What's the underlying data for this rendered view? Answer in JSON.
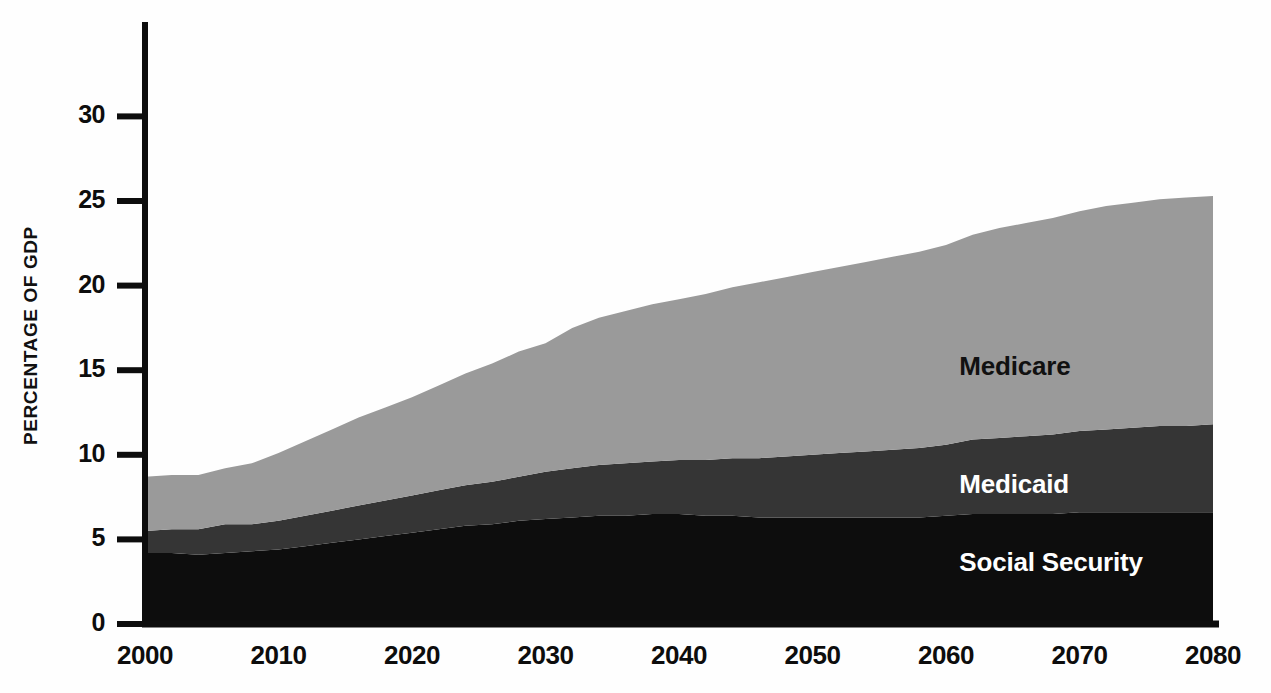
{
  "chart_data": {
    "type": "area",
    "stacked": true,
    "title": "",
    "subtitle": "",
    "xlabel": "",
    "ylabel": "PERCENTAGE OF GDP",
    "xlim": [
      2000,
      2080
    ],
    "ylim": [
      0,
      34
    ],
    "grid": false,
    "legend_position": "inline-annotations",
    "x_ticks": [
      "2000",
      "2010",
      "2020",
      "2030",
      "2040",
      "2050",
      "2060",
      "2070",
      "2080"
    ],
    "y_ticks": [
      "0",
      "5",
      "10",
      "15",
      "20",
      "25",
      "30"
    ],
    "x": [
      2000,
      2002,
      2004,
      2006,
      2008,
      2010,
      2012,
      2014,
      2016,
      2018,
      2020,
      2022,
      2024,
      2026,
      2028,
      2030,
      2032,
      2034,
      2036,
      2038,
      2040,
      2042,
      2044,
      2046,
      2048,
      2050,
      2052,
      2054,
      2056,
      2058,
      2060,
      2062,
      2064,
      2066,
      2068,
      2070,
      2072,
      2074,
      2076,
      2078,
      2080
    ],
    "series": [
      {
        "name": "Social Security",
        "color": "#0d0d0d",
        "label_color": "#ffffff",
        "values": [
          4.2,
          4.2,
          4.1,
          4.2,
          4.3,
          4.4,
          4.6,
          4.8,
          5.0,
          5.2,
          5.4,
          5.6,
          5.8,
          5.9,
          6.1,
          6.2,
          6.3,
          6.4,
          6.4,
          6.5,
          6.5,
          6.4,
          6.4,
          6.3,
          6.3,
          6.3,
          6.3,
          6.3,
          6.3,
          6.3,
          6.4,
          6.5,
          6.5,
          6.5,
          6.5,
          6.6,
          6.6,
          6.6,
          6.6,
          6.6,
          6.6
        ]
      },
      {
        "name": "Medicaid",
        "color": "#353535",
        "label_color": "#ffffff",
        "values": [
          1.3,
          1.4,
          1.5,
          1.7,
          1.6,
          1.7,
          1.8,
          1.9,
          2.0,
          2.1,
          2.2,
          2.3,
          2.4,
          2.5,
          2.6,
          2.8,
          2.9,
          3.0,
          3.1,
          3.1,
          3.2,
          3.3,
          3.4,
          3.5,
          3.6,
          3.7,
          3.8,
          3.9,
          4.0,
          4.1,
          4.2,
          4.4,
          4.5,
          4.6,
          4.7,
          4.8,
          4.9,
          5.0,
          5.1,
          5.1,
          5.2
        ]
      },
      {
        "name": "Medicare",
        "color": "#9a9a9a",
        "label_color": "#111111",
        "values": [
          3.2,
          3.2,
          3.2,
          3.3,
          3.6,
          4.0,
          4.4,
          4.8,
          5.2,
          5.5,
          5.8,
          6.2,
          6.6,
          7.0,
          7.4,
          7.6,
          8.3,
          8.7,
          9.0,
          9.3,
          9.5,
          9.8,
          10.1,
          10.4,
          10.6,
          10.8,
          11.0,
          11.2,
          11.4,
          11.6,
          11.8,
          12.1,
          12.4,
          12.6,
          12.8,
          13.0,
          13.2,
          13.3,
          13.4,
          13.5,
          13.5
        ]
      }
    ],
    "totals": [
      8.7,
      8.8,
      8.8,
      9.2,
      9.5,
      10.1,
      10.8,
      11.5,
      12.2,
      12.8,
      13.4,
      14.1,
      14.8,
      15.4,
      16.1,
      16.6,
      17.5,
      18.1,
      18.5,
      18.9,
      19.2,
      19.5,
      19.9,
      20.2,
      20.5,
      20.8,
      21.1,
      21.4,
      21.7,
      22.0,
      22.4,
      23.0,
      23.4,
      23.7,
      24.0,
      24.4,
      24.7,
      24.9,
      25.1,
      25.2,
      25.3
    ],
    "annotations": [
      {
        "text": "Medicare",
        "x": 2061,
        "y": 15.2
      },
      {
        "text": "Medicaid",
        "x": 2061,
        "y": 8.2
      },
      {
        "text": "Social Security",
        "x": 2061,
        "y": 3.6
      }
    ],
    "colors": {
      "social_security": "#0d0d0d",
      "medicaid": "#353535",
      "medicare": "#9a9a9a",
      "axis": "#0d0d0d",
      "background": "#fefefe"
    }
  },
  "axis": {
    "y_title": "PERCENTAGE OF GDP"
  }
}
